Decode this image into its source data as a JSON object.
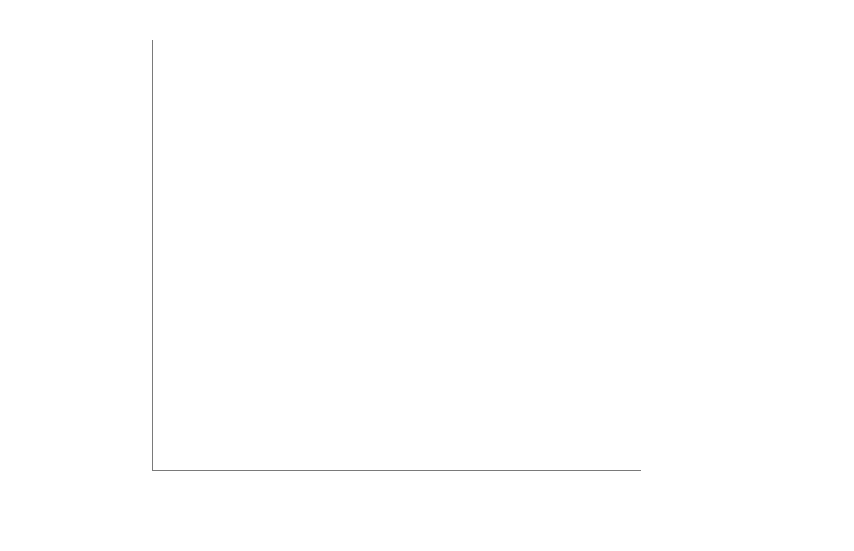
{
  "chart_data": {
    "type": "line",
    "title": "",
    "xlabel": "MW",
    "ylabel": "Present value (USD/MW)",
    "categories": [
      "2,500",
      "3,000",
      "4,000",
      "5,000",
      "6,000",
      "8,000",
      "10,000",
      "12,000"
    ],
    "x_tick_labels": [
      "2,500",
      "3,000",
      "4,000",
      "5,000",
      "6,000",
      "8,000",
      "10,000",
      "12,000"
    ],
    "y_tick_labels": [
      "4000.00",
      "3500.00",
      "3000.00",
      "2500.00",
      "1000.00",
      "500.00"
    ],
    "y_tick_positions": [
      40,
      101,
      223,
      284,
      345,
      467
    ],
    "grid": true,
    "gridlines_y": [
      40,
      101,
      162,
      223,
      284,
      345,
      406,
      467
    ],
    "legend_position": "right",
    "drop_lines": true,
    "series": [
      {
        "name": "AC500 kV",
        "color": "#6b8fd4",
        "marker": "diamond",
        "values": [
          660,
          700,
          780,
          880,
          975,
          1210,
          2530,
          2780
        ],
        "pixel_y": [
          424,
          417,
          402,
          380,
          358,
          337,
          302,
          272
        ]
      },
      {
        "name": "AC765 kV",
        "color": "#c0504d",
        "marker": "square",
        "values": [
          730,
          745,
          810,
          935,
          1000,
          1215,
          2535,
          2790
        ],
        "pixel_y": [
          408,
          405,
          394,
          368,
          357,
          337,
          302,
          272
        ]
      },
      {
        "name": "DC500 kV",
        "color": "#9bbb59",
        "marker": "triangle",
        "values": [
          820,
          900,
          1120,
          2400,
          2620,
          3110,
          3390,
          3690
        ],
        "pixel_y": [
          385,
          372,
          348,
          315,
          288,
          228,
          170,
          110
        ]
      }
    ]
  },
  "legend": {
    "items": [
      {
        "label": "AC500 kV",
        "color": "#6b8fd4",
        "marker": "diamond"
      },
      {
        "label": "AC765 kV",
        "color": "#c0504d",
        "marker": "square"
      },
      {
        "label": "DC500 kV",
        "color": "#9bbb59",
        "marker": "triangle"
      }
    ]
  },
  "colors": {
    "ac500": "#6b8fd4",
    "ac765": "#c0504d",
    "dc500": "#9bbb59",
    "gridline": "#b9b9b9",
    "axis": "#7a7a7a",
    "dropline": "#303030",
    "text": "#1a1a1a",
    "background": "#ffffff"
  }
}
